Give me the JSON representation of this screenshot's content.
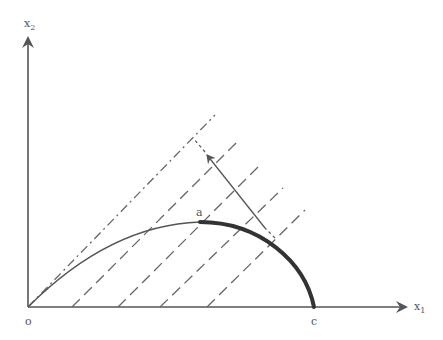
{
  "diagram": {
    "type": "production-possibility / iso-value lines",
    "axes": {
      "x_label": "x",
      "x_sub": "1",
      "y_label": "x",
      "y_sub": "2",
      "origin_label": "o"
    },
    "points": {
      "a_label": "a",
      "c_label": "c"
    },
    "colors": {
      "ink": "#555555",
      "curve_bold": "#333333"
    },
    "dash_dot_line": {
      "from": [
        28,
        307
      ],
      "to": [
        215,
        115
      ]
    },
    "dashed_lines": [
      {
        "from": [
          72,
          307
        ],
        "to": [
          237,
          142
        ]
      },
      {
        "from": [
          118,
          307
        ],
        "to": [
          260,
          165
        ]
      },
      {
        "from": [
          160,
          307
        ],
        "to": [
          283,
          188
        ]
      },
      {
        "from": [
          207,
          307
        ],
        "to": [
          305,
          210
        ]
      }
    ],
    "direction_arrow": {
      "from": [
        275,
        238
      ],
      "to": [
        207,
        155
      ]
    }
  }
}
